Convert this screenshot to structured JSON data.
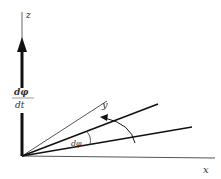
{
  "diagram": {
    "labels": {
      "z": "z",
      "y": "y",
      "x": "x",
      "angle": "dφ",
      "rate_numerator": "dφ",
      "rate_denominator": "dt"
    },
    "colors": {
      "line": "#111111",
      "thin": "#555555",
      "background": "#ffffff"
    }
  }
}
